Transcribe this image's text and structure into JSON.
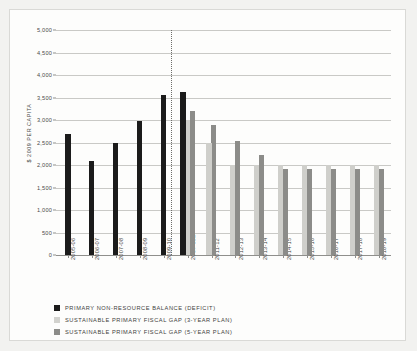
{
  "chart_data": {
    "type": "bar",
    "title": "",
    "subtitle": "",
    "xlabel": "",
    "ylabel": "$ 2009 PER CAPITA",
    "ylim": [
      0,
      5000
    ],
    "ytick_values": [
      0,
      500,
      1000,
      1500,
      2000,
      2500,
      3000,
      3500,
      4000,
      4500,
      5000
    ],
    "ytick_labels": [
      "0",
      "500",
      "1,000",
      "1,500",
      "2,000",
      "2,500",
      "3,000",
      "3,500",
      "4,000",
      "4,500",
      "5,000"
    ],
    "grid": true,
    "legend_position": "below",
    "categories": [
      "2005-06",
      "2006-07",
      "2007-08",
      "2008-09",
      "2009-10",
      "2010-11E",
      "2011-12",
      "2012-13",
      "2013-14",
      "2014-15",
      "2015-16",
      "2016-17",
      "2017-18",
      "2018-19"
    ],
    "series": [
      {
        "name": "PRIMARY NON-RESOURCE BALANCE (DEFICIT)",
        "color": "#1b1b1b",
        "values": [
          2680,
          2080,
          2500,
          2980,
          3550,
          3630,
          null,
          null,
          null,
          null,
          null,
          null,
          null,
          null
        ]
      },
      {
        "name": "SUSTAINABLE PRIMARY FISCAL GAP (3-YEAR PLAN)",
        "color": "#cfcfcb",
        "values": [
          null,
          null,
          null,
          null,
          null,
          3010,
          2500,
          2000,
          2000,
          2000,
          2000,
          2000,
          2000,
          2000
        ]
      },
      {
        "name": "SUSTAINABLE PRIMARY FISCAL GAP (5-YEAR PLAN)",
        "color": "#8c8c89",
        "values": [
          null,
          null,
          null,
          null,
          null,
          3200,
          2880,
          2540,
          2230,
          1910,
          1910,
          1910,
          1910,
          1910
        ]
      }
    ],
    "annotations": [
      {
        "type": "vertical-dotted-divider",
        "after_category": "2009-10"
      }
    ]
  }
}
